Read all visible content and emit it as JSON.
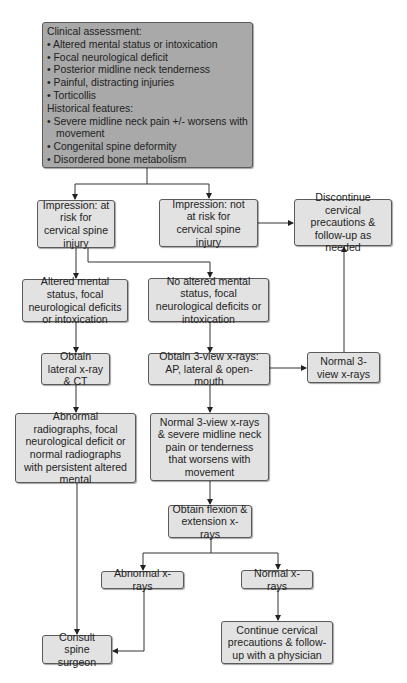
{
  "diagram": {
    "type": "flowchart",
    "topic": "Cervical spine injury evaluation",
    "nodes": {
      "assessment": {
        "clinical_header": "Clinical assessment:",
        "clinical_items": [
          "• Altered mental status or intoxication",
          "• Focal neurological deficit",
          "• Posterior midline neck tenderness",
          "• Painful, distracting injuries",
          "• Torticollis"
        ],
        "historical_header": "Historical features:",
        "historical_items": [
          "• Severe midline neck pain +/- worsens with movement",
          "• Congenital spine deformity",
          "• Disordered bone metabolism"
        ]
      },
      "at_risk": "Impression: at risk for cervical spine injury",
      "not_at_risk": "Impression: not at risk for cervical spine injury",
      "discontinue": "Discontinue cervical precautions & follow-up as needed",
      "altered": "Altered mental status, focal neurological deficits or intoxication",
      "no_altered": "No altered mental status, focal neurological deficits or intoxication",
      "lateral_ct": "Obtain lateral x-ray & CT",
      "three_view": "Obtain 3-view x-rays: AP, lateral & open-mouth",
      "normal_three_view": "Normal 3-view x-rays",
      "abnormal_radiographs": "Abnormal radiographs, focal neurological deficit or normal radiographs with persistent altered mental",
      "normal_severe": "Normal 3-view x-rays & severe midline neck pain or tenderness that worsens with movement",
      "flexion_extension": "Obtain flexion & extension x-rays",
      "abnormal_xrays": "Abnormal x-rays",
      "normal_xrays": "Normal x-rays",
      "consult": "Consult spine surgeon",
      "continue": "Continue cervical precautions & follow-up with a physician"
    },
    "edges": [
      [
        "assessment",
        "at_risk"
      ],
      [
        "assessment",
        "not_at_risk"
      ],
      [
        "not_at_risk",
        "discontinue"
      ],
      [
        "at_risk",
        "altered"
      ],
      [
        "at_risk",
        "no_altered"
      ],
      [
        "altered",
        "lateral_ct"
      ],
      [
        "no_altered",
        "three_view"
      ],
      [
        "three_view",
        "normal_three_view"
      ],
      [
        "normal_three_view",
        "discontinue"
      ],
      [
        "lateral_ct",
        "abnormal_radiographs"
      ],
      [
        "three_view",
        "normal_severe"
      ],
      [
        "normal_severe",
        "flexion_extension"
      ],
      [
        "flexion_extension",
        "abnormal_xrays"
      ],
      [
        "flexion_extension",
        "normal_xrays"
      ],
      [
        "abnormal_radiographs",
        "consult"
      ],
      [
        "abnormal_xrays",
        "consult"
      ],
      [
        "normal_xrays",
        "continue"
      ]
    ],
    "colors": {
      "header_box": "#a9a9a9",
      "box": "#e2e2e2",
      "line": "#333333"
    }
  }
}
